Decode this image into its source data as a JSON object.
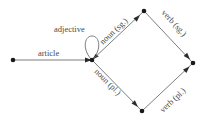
{
  "diagram": {
    "type": "finite-state-automaton",
    "nodes": [
      {
        "id": "start",
        "x": 13,
        "y": 60
      },
      {
        "id": "mid",
        "x": 92,
        "y": 60
      },
      {
        "id": "top",
        "x": 144,
        "y": 11
      },
      {
        "id": "right",
        "x": 193,
        "y": 63
      },
      {
        "id": "bottom",
        "x": 142,
        "y": 111
      }
    ],
    "edges": [
      {
        "from": "start",
        "to": "mid",
        "label": "article"
      },
      {
        "from": "mid",
        "to": "mid",
        "label": "adjective"
      },
      {
        "from": "mid",
        "to": "top",
        "label": "noun (sg.)"
      },
      {
        "from": "mid",
        "to": "bottom",
        "label": "noun (pl.)"
      },
      {
        "from": "top",
        "to": "right",
        "label": "verb (sg.)"
      },
      {
        "from": "bottom",
        "to": "right",
        "label": "verb (pl.)"
      }
    ],
    "labels": {
      "article": "article",
      "adjective": "adjective",
      "noun_sg": "noun (sg.)",
      "noun_pl": "noun (pl.)",
      "verb_sg": "verb (sg.)",
      "verb_pl": "verb (pl.)"
    },
    "colors": {
      "edge": "#6e6e6e",
      "node": "#1a1a1a",
      "text": "#4a4a4a"
    }
  }
}
